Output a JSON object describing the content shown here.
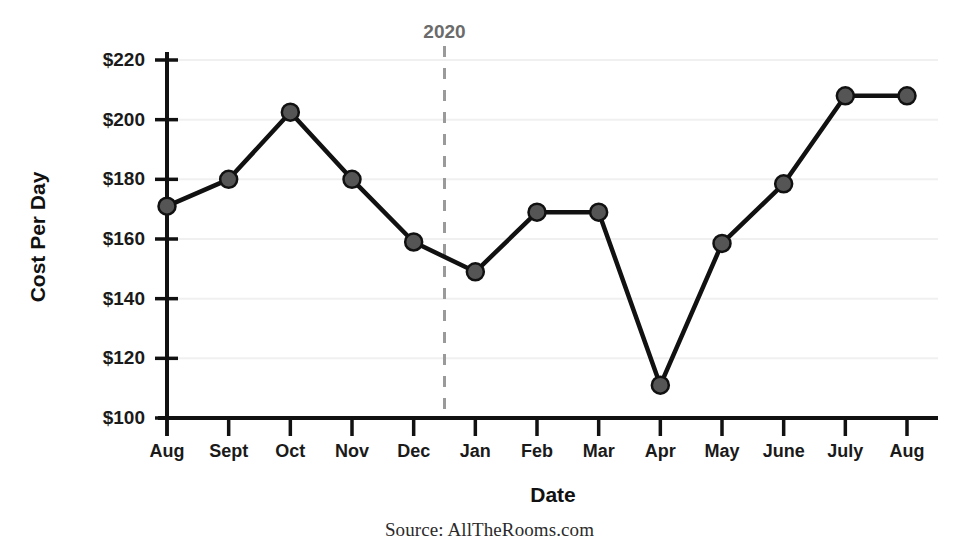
{
  "chart_data": {
    "type": "line",
    "title": "",
    "xlabel": "Date",
    "ylabel": "Cost Per Day",
    "categories": [
      "Aug",
      "Sept",
      "Oct",
      "Nov",
      "Dec",
      "Jan",
      "Feb",
      "Mar",
      "Apr",
      "May",
      "June",
      "July",
      "Aug"
    ],
    "values": [
      171,
      180,
      202.5,
      180,
      159,
      149,
      169,
      169,
      111,
      158.5,
      178.5,
      208,
      208
    ],
    "ylim": [
      100,
      220
    ],
    "ytick_values": [
      100,
      120,
      140,
      160,
      180,
      200,
      220
    ],
    "ytick_labels": [
      "$100",
      "$120",
      "$140",
      "$160",
      "$180",
      "$200",
      "$220"
    ],
    "grid": true,
    "legend": "none",
    "series_name": "Cost Per Day",
    "annotations": [
      {
        "label": "2020",
        "type": "vertical-dashed-line",
        "x_between": [
          "Dec",
          "Jan"
        ],
        "x_index": 4.5
      }
    ],
    "marker": {
      "shape": "circle",
      "fill": "#555555",
      "stroke": "#111111"
    },
    "line_color": "#111111",
    "grid_color": "#f0f0f0",
    "axis_color": "#111111"
  },
  "footer": {
    "source": "Source: AllTheRooms.com"
  }
}
